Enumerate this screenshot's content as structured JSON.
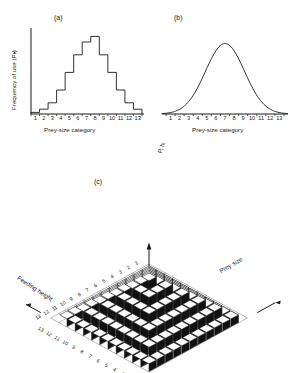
{
  "figure": {
    "panels": [
      {
        "id": "a",
        "letter": "(a)",
        "ylabel": "Frequency of use (Pₕ)",
        "xlabel": "Prey-size category"
      },
      {
        "id": "b",
        "letter": "(b)",
        "ylabel": "",
        "xlabel": "Prey-size category"
      },
      {
        "id": "c",
        "letter": "(c)",
        "zlabel": "Pᵢ hᵢ",
        "left_axis_label": "Feeding height",
        "right_axis_label": "Prey size"
      }
    ]
  },
  "chart_data": [
    {
      "type": "bar",
      "panel": "a",
      "title": "(a)",
      "xlabel": "Prey-size category",
      "ylabel": "Frequency of use (Pₕ)",
      "categories": [
        "1",
        "2",
        "3",
        "4",
        "5",
        "6",
        "7",
        "8",
        "9",
        "10",
        "11",
        "12",
        "13"
      ],
      "values": [
        0.02,
        0.06,
        0.14,
        0.3,
        0.52,
        0.74,
        0.9,
        0.97,
        0.74,
        0.52,
        0.3,
        0.14,
        0.06
      ],
      "ylim": [
        0,
        1.05
      ],
      "grid": false,
      "legend": null,
      "note": "step histogram, unlabelled y-axis scale"
    },
    {
      "type": "line",
      "panel": "b",
      "title": "(b)",
      "xlabel": "Prey-size category",
      "ylabel": "",
      "x": [
        1,
        2,
        3,
        4,
        5,
        6,
        7,
        8,
        9,
        10,
        11,
        12,
        13
      ],
      "values": [
        0.03,
        0.08,
        0.19,
        0.39,
        0.66,
        0.9,
        1.0,
        0.9,
        0.66,
        0.39,
        0.19,
        0.08,
        0.03
      ],
      "ylim": [
        0,
        1.05
      ],
      "grid": false,
      "legend": null,
      "note": "smooth normal (gaussian) curve, no y-axis drawn"
    },
    {
      "type": "bar",
      "panel": "c",
      "title": "(c)",
      "xlabel": "Prey size",
      "ylabel": "Feeding height",
      "zlabel": "Pᵢ hᵢ",
      "x_categories": [
        "13",
        "12",
        "11",
        "10",
        "9",
        "8",
        "7",
        "6",
        "5",
        "4",
        "3",
        "2",
        "1"
      ],
      "y_categories": [
        "1",
        "2",
        "3",
        "4",
        "5",
        "6",
        "7",
        "8",
        "9",
        "10",
        "11",
        "12",
        "13"
      ],
      "projection": "isometric-3d-bars",
      "note": "pyramid of 3D bars; heights peak at centre of both axes",
      "values": [
        [
          0,
          0,
          0,
          0,
          0,
          0,
          0,
          0,
          0,
          0,
          0,
          0,
          0
        ],
        [
          0,
          1,
          1,
          1,
          1,
          1,
          1,
          1,
          1,
          1,
          1,
          1,
          0
        ],
        [
          0,
          1,
          2,
          2,
          2,
          2,
          2,
          2,
          2,
          2,
          2,
          1,
          0
        ],
        [
          0,
          1,
          2,
          3,
          3,
          3,
          3,
          3,
          3,
          3,
          2,
          1,
          0
        ],
        [
          0,
          1,
          2,
          3,
          4,
          4,
          4,
          4,
          4,
          3,
          2,
          1,
          0
        ],
        [
          0,
          1,
          2,
          3,
          4,
          5,
          5,
          5,
          4,
          3,
          2,
          1,
          0
        ],
        [
          0,
          1,
          2,
          3,
          4,
          5,
          6,
          5,
          4,
          3,
          2,
          1,
          0
        ],
        [
          0,
          1,
          2,
          3,
          4,
          5,
          5,
          5,
          4,
          3,
          2,
          1,
          0
        ],
        [
          0,
          1,
          2,
          3,
          4,
          4,
          4,
          4,
          4,
          3,
          2,
          1,
          0
        ],
        [
          0,
          1,
          2,
          3,
          3,
          3,
          3,
          3,
          3,
          3,
          2,
          1,
          0
        ],
        [
          0,
          1,
          2,
          2,
          2,
          2,
          2,
          2,
          2,
          2,
          2,
          1,
          0
        ],
        [
          0,
          1,
          1,
          1,
          1,
          1,
          1,
          1,
          1,
          1,
          1,
          1,
          0
        ],
        [
          0,
          0,
          0,
          0,
          0,
          0,
          0,
          0,
          0,
          0,
          0,
          0,
          0
        ]
      ]
    }
  ],
  "colors": {
    "ink": "#1a1a1a",
    "paper": "#ffffff",
    "bar_light": "#f4f4f4",
    "bar_dark": "#111111",
    "bar_mid": "#ffffff"
  }
}
